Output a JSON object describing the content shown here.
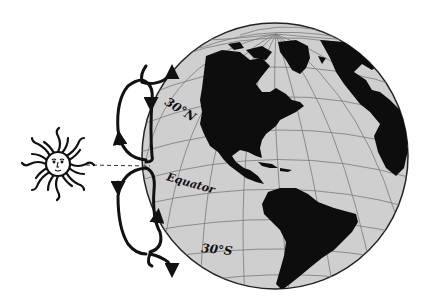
{
  "diagram": {
    "labels": {
      "north": "30°N",
      "equator": "Equator",
      "south": "30°S"
    },
    "elements": {
      "sun": "sun-icon",
      "globe": "globe-icon",
      "sun_ray": "dashed line from sun to equator",
      "cells": [
        "northern circulation cell",
        "southern circulation cell"
      ]
    },
    "colors": {
      "ocean": "#cfcfcf",
      "land": "#0d0d0d",
      "grid": "#7a7a7a",
      "ink": "#111111",
      "background": "#ffffff"
    }
  }
}
